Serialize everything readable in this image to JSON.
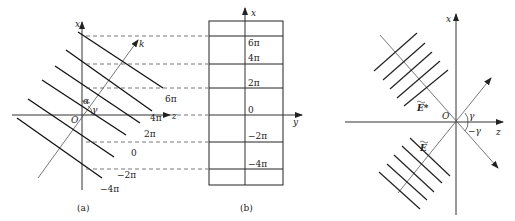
{
  "panel_a": {
    "caption": "(a)",
    "axis_x": "x",
    "axis_z": "z",
    "origin": "O",
    "wave_vector": "k",
    "angle_alpha": "α",
    "angle_gamma": "γ",
    "phase_labels": [
      "6π",
      "4π",
      "2π",
      "0",
      "−2π",
      "−4π"
    ]
  },
  "panel_b": {
    "caption": "(b)",
    "axis_x": "x",
    "axis_y": "y",
    "phase_labels": [
      "6π",
      "4π",
      "2π",
      "0",
      "−2π",
      "−4π"
    ]
  },
  "panel_c": {
    "axis_x": "x",
    "axis_z": "z",
    "origin": "O",
    "angle_gamma": "γ",
    "angle_neg_gamma": "−γ",
    "field_conj": "E*",
    "field": "E"
  }
}
